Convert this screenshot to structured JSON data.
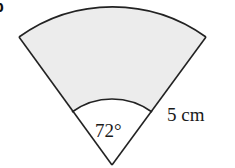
{
  "figure": {
    "part_label": "b",
    "shape": "annular sector (ring segment)",
    "angle_label": "72°",
    "width_label": "5 cm",
    "colors": {
      "shaded_fill": "#ececec",
      "stroke": "#222222",
      "inner_fill": "#ffffff"
    }
  }
}
